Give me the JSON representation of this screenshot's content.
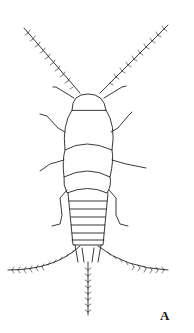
{
  "figure": {
    "panel_label": "A",
    "colors": {
      "line": "#222222",
      "background": "#ffffff"
    }
  }
}
